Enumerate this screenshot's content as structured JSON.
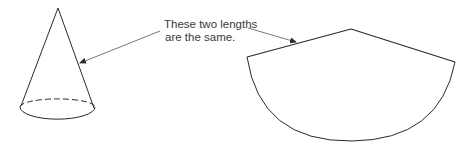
{
  "diagram": {
    "annotation": {
      "line1": "These two lengths",
      "line2": "are the same."
    },
    "figures": [
      {
        "name": "cone",
        "description": "3D cone with dashed back edge of circular base"
      },
      {
        "name": "sector",
        "description": "Unrolled lateral surface of cone as a circular sector"
      }
    ],
    "colors": {
      "stroke": "#2a2a2a",
      "text": "#3a3a3a",
      "background": "#ffffff"
    }
  }
}
